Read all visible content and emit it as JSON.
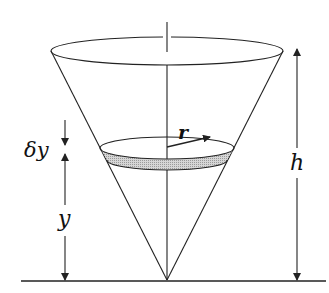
{
  "diagram": {
    "labels": {
      "delta_y": "δy",
      "y": "y",
      "h": "h",
      "r": "r"
    },
    "colors": {
      "stroke": "#222222",
      "slice_fill": "#c8c8c8",
      "background": "#ffffff"
    },
    "geometry": {
      "apex": [
        167,
        280
      ],
      "top_ellipse": {
        "cx": 167,
        "cy": 51,
        "rx": 116,
        "ry": 14
      },
      "slice_top_ellipse": {
        "cx": 167,
        "cy": 148,
        "rx": 67,
        "ry": 11
      },
      "slice_bottom_ellipse": {
        "cx": 167,
        "cy": 160,
        "rx": 60,
        "ry": 10
      },
      "baseline": {
        "x1": 21,
        "x2": 326,
        "y": 281
      }
    }
  }
}
